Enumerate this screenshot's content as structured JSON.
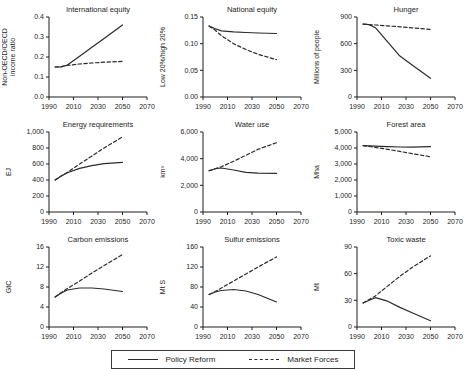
{
  "legend": {
    "position": "bottom",
    "series": [
      {
        "label": "Policy Reform",
        "line_style": "solid"
      },
      {
        "label": "Market Forces",
        "line_style": "dashed"
      }
    ]
  },
  "colors": {
    "line": "#2b2b2b",
    "axis": "#1c1c1c",
    "text": "#1c1c1c",
    "background": "#ffffff"
  },
  "chart_data": [
    {
      "type": "line",
      "title": "International equity",
      "ylabel_lines": [
        "Non-OECD/OECD",
        "income ratio"
      ],
      "xlim": [
        1990,
        2070
      ],
      "ylim": [
        0,
        0.4
      ],
      "xticks": [
        1990,
        2010,
        2030,
        2050,
        2070
      ],
      "xtick_labels": [
        "1990",
        "2010",
        "2030",
        "2050",
        "2070"
      ],
      "yticks": [
        0,
        0.1,
        0.2,
        0.3,
        0.4
      ],
      "ytick_labels": [
        "0.0",
        "0.1",
        "0.2",
        "0.3",
        "0.4"
      ],
      "x": [
        1995,
        2000,
        2005,
        2015,
        2025,
        2035,
        2050
      ],
      "series": [
        {
          "name": "Policy Reform",
          "line_style": "solid",
          "values": [
            0.15,
            0.151,
            0.16,
            0.204,
            0.249,
            0.293,
            0.36
          ]
        },
        {
          "name": "Market Forces",
          "line_style": "dashed",
          "values": [
            0.15,
            0.152,
            0.158,
            0.165,
            0.17,
            0.174,
            0.178
          ]
        }
      ]
    },
    {
      "type": "line",
      "title": "National equity",
      "ylabel_lines": [
        "Low 20%/high 20%"
      ],
      "xlim": [
        1990,
        2070
      ],
      "ylim": [
        0,
        0.15
      ],
      "xticks": [
        1990,
        2010,
        2030,
        2050,
        2070
      ],
      "xtick_labels": [
        "1990",
        "2010",
        "2030",
        "2050",
        "2070"
      ],
      "yticks": [
        0,
        0.05,
        0.1,
        0.15
      ],
      "ytick_labels": [
        "0.00",
        "0.05",
        "0.10",
        "0.15"
      ],
      "x": [
        1995,
        2000,
        2005,
        2015,
        2025,
        2035,
        2050
      ],
      "series": [
        {
          "name": "Policy Reform",
          "line_style": "solid",
          "values": [
            0.133,
            0.128,
            0.124,
            0.122,
            0.121,
            0.12,
            0.119
          ]
        },
        {
          "name": "Market Forces",
          "line_style": "dashed",
          "values": [
            0.133,
            0.125,
            0.115,
            0.1,
            0.089,
            0.08,
            0.07
          ]
        }
      ]
    },
    {
      "type": "line",
      "title": "Hunger",
      "ylabel_lines": [
        "Millions of people"
      ],
      "xlim": [
        1990,
        2070
      ],
      "ylim": [
        0,
        900
      ],
      "xticks": [
        1990,
        2010,
        2030,
        2050,
        2070
      ],
      "xtick_labels": [
        "1990",
        "2010",
        "2030",
        "2050",
        "2070"
      ],
      "yticks": [
        0,
        300,
        600,
        900
      ],
      "ytick_labels": [
        "0",
        "300",
        "600",
        "900"
      ],
      "x": [
        1995,
        2000,
        2005,
        2015,
        2025,
        2035,
        2050
      ],
      "series": [
        {
          "name": "Policy Reform",
          "line_style": "solid",
          "values": [
            820,
            815,
            780,
            620,
            460,
            360,
            210
          ]
        },
        {
          "name": "Market Forces",
          "line_style": "dashed",
          "values": [
            820,
            815,
            810,
            800,
            790,
            778,
            760
          ]
        }
      ]
    },
    {
      "type": "line",
      "title": "Energy requirements",
      "ylabel_lines": [
        "EJ"
      ],
      "xlim": [
        1990,
        2070
      ],
      "ylim": [
        0,
        1000
      ],
      "xticks": [
        1990,
        2010,
        2030,
        2050,
        2070
      ],
      "xtick_labels": [
        "1990",
        "2010",
        "2030",
        "2050",
        "2070"
      ],
      "yticks": [
        0,
        200,
        400,
        600,
        800,
        1000
      ],
      "ytick_labels": [
        "0",
        "200",
        "400",
        "600",
        "800",
        "1,000"
      ],
      "x": [
        1995,
        2000,
        2005,
        2015,
        2025,
        2035,
        2050
      ],
      "series": [
        {
          "name": "Policy Reform",
          "line_style": "solid",
          "values": [
            400,
            450,
            490,
            545,
            580,
            605,
            620
          ]
        },
        {
          "name": "Market Forces",
          "line_style": "dashed",
          "values": [
            400,
            450,
            495,
            600,
            700,
            800,
            940
          ]
        }
      ]
    },
    {
      "type": "line",
      "title": "Water use",
      "ylabel_lines": [
        "km³"
      ],
      "xlim": [
        1990,
        2070
      ],
      "ylim": [
        0,
        6000
      ],
      "xticks": [
        1990,
        2010,
        2030,
        2050,
        2070
      ],
      "xtick_labels": [
        "1990",
        "2010",
        "2030",
        "2050",
        "2070"
      ],
      "yticks": [
        0,
        2000,
        4000,
        6000
      ],
      "ytick_labels": [
        "0",
        "2,000",
        "4,000",
        "6,000"
      ],
      "x": [
        1995,
        2000,
        2005,
        2015,
        2025,
        2035,
        2050
      ],
      "series": [
        {
          "name": "Policy Reform",
          "line_style": "solid",
          "values": [
            3100,
            3250,
            3300,
            3150,
            2980,
            2920,
            2900
          ]
        },
        {
          "name": "Market Forces",
          "line_style": "dashed",
          "values": [
            3100,
            3250,
            3400,
            3800,
            4250,
            4700,
            5200
          ]
        }
      ]
    },
    {
      "type": "line",
      "title": "Forest area",
      "ylabel_lines": [
        "Mha"
      ],
      "xlim": [
        1990,
        2070
      ],
      "ylim": [
        0,
        5000
      ],
      "xticks": [
        1990,
        2010,
        2030,
        2050,
        2070
      ],
      "xtick_labels": [
        "1990",
        "2010",
        "2030",
        "2050",
        "2070"
      ],
      "yticks": [
        0,
        1000,
        2000,
        3000,
        4000,
        5000
      ],
      "ytick_labels": [
        "0",
        "1,000",
        "2,000",
        "3,000",
        "4,000",
        "5,000"
      ],
      "x": [
        1995,
        2000,
        2005,
        2015,
        2025,
        2035,
        2050
      ],
      "series": [
        {
          "name": "Policy Reform",
          "line_style": "solid",
          "values": [
            4150,
            4130,
            4110,
            4080,
            4060,
            4055,
            4080
          ]
        },
        {
          "name": "Market Forces",
          "line_style": "dashed",
          "values": [
            4150,
            4100,
            4040,
            3920,
            3790,
            3650,
            3450
          ]
        }
      ]
    },
    {
      "type": "line",
      "title": "Carbon emissions",
      "ylabel_lines": [
        "GtC"
      ],
      "xlim": [
        1990,
        2070
      ],
      "ylim": [
        0,
        16
      ],
      "xticks": [
        1990,
        2010,
        2030,
        2050,
        2070
      ],
      "xtick_labels": [
        "1990",
        "2010",
        "2030",
        "2050",
        "2070"
      ],
      "yticks": [
        0,
        4,
        8,
        12,
        16
      ],
      "ytick_labels": [
        "0",
        "4",
        "8",
        "12",
        "16"
      ],
      "x": [
        1995,
        2000,
        2005,
        2015,
        2025,
        2035,
        2050
      ],
      "series": [
        {
          "name": "Policy Reform",
          "line_style": "solid",
          "values": [
            6,
            6.8,
            7.4,
            7.8,
            7.8,
            7.6,
            7.1
          ]
        },
        {
          "name": "Market Forces",
          "line_style": "dashed",
          "values": [
            6,
            6.9,
            7.7,
            9.2,
            10.8,
            12.3,
            14.5
          ]
        }
      ]
    },
    {
      "type": "line",
      "title": "Sulfur emissions",
      "ylabel_lines": [
        "Mt S"
      ],
      "xlim": [
        1990,
        2070
      ],
      "ylim": [
        0,
        160
      ],
      "xticks": [
        1990,
        2010,
        2030,
        2050,
        2070
      ],
      "xtick_labels": [
        "1990",
        "2010",
        "2030",
        "2050",
        "2070"
      ],
      "yticks": [
        0,
        40,
        80,
        120,
        160
      ],
      "ytick_labels": [
        "0",
        "40",
        "80",
        "120",
        "160"
      ],
      "x": [
        1995,
        2000,
        2005,
        2015,
        2025,
        2035,
        2050
      ],
      "series": [
        {
          "name": "Policy Reform",
          "line_style": "solid",
          "values": [
            65,
            70,
            73,
            75,
            72,
            65,
            50
          ]
        },
        {
          "name": "Market Forces",
          "line_style": "dashed",
          "values": [
            65,
            71,
            78,
            92,
            106,
            120,
            140
          ]
        }
      ]
    },
    {
      "type": "line",
      "title": "Toxic waste",
      "ylabel_lines": [
        "Mt"
      ],
      "xlim": [
        1990,
        2070
      ],
      "ylim": [
        0,
        90
      ],
      "xticks": [
        1990,
        2010,
        2030,
        2050,
        2070
      ],
      "xtick_labels": [
        "1990",
        "2010",
        "2030",
        "2050",
        "2070"
      ],
      "yticks": [
        0,
        30,
        60,
        90
      ],
      "ytick_labels": [
        "0",
        "30",
        "60",
        "90"
      ],
      "x": [
        1995,
        2000,
        2005,
        2015,
        2025,
        2035,
        2050
      ],
      "series": [
        {
          "name": "Policy Reform",
          "line_style": "solid",
          "values": [
            27,
            30,
            33,
            29,
            22,
            16,
            7
          ]
        },
        {
          "name": "Market Forces",
          "line_style": "dashed",
          "values": [
            27,
            31,
            35,
            46,
            57,
            67,
            80
          ]
        }
      ]
    }
  ]
}
